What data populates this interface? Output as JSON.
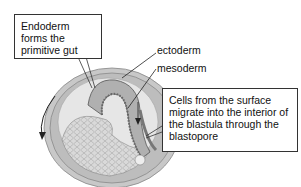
{
  "diagram": {
    "type": "gastrulation-cross-section",
    "callouts": {
      "endoderm": "Endoderm forms the primitive gut",
      "migration": "Cells from the surface migrate into the interior of the blastula through the blastopore"
    },
    "labels": {
      "ectoderm": "ectoderm",
      "mesoderm": "mesoderm"
    }
  }
}
